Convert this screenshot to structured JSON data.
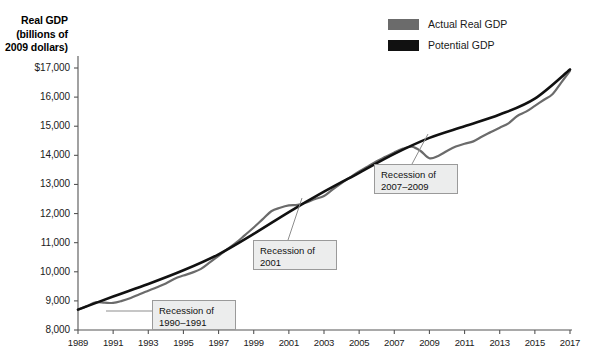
{
  "chart_data": {
    "type": "line",
    "title": "Real GDP (billions of 2009 dollars)",
    "ylabel_line1": "Real GDP",
    "ylabel_line2": "(billions of",
    "ylabel_line3": "2009 dollars)",
    "xlabel": "",
    "xlim": [
      1989,
      2017
    ],
    "ylim": [
      8000,
      17000
    ],
    "grid": false,
    "legend_position": "top-right",
    "ytick_labels": [
      "$17,000",
      "16,000",
      "15,000",
      "14,000",
      "13,000",
      "12,000",
      "11,000",
      "10,000",
      "9,000",
      "8,000"
    ],
    "ytick_values": [
      17000,
      16000,
      15000,
      14000,
      13000,
      12000,
      11000,
      10000,
      9000,
      8000
    ],
    "xtick_labels": [
      "1989",
      "1991",
      "1993",
      "1995",
      "1997",
      "1999",
      "2001",
      "2003",
      "2005",
      "2007",
      "2009",
      "2011",
      "2013",
      "2015",
      "2017"
    ],
    "xtick_values": [
      1989,
      1991,
      1993,
      1995,
      1997,
      1999,
      2001,
      2003,
      2005,
      2007,
      2009,
      2011,
      2013,
      2015,
      2017
    ],
    "colors": {
      "actual": "#6b6b6b",
      "potential": "#111111",
      "axis": "#555555",
      "callout_fill": "#eceded",
      "callout_border": "#9a9a9a"
    },
    "series": [
      {
        "name": "Actual Real GDP",
        "color": "#6b6b6b",
        "x": [
          1989,
          1989.5,
          1990,
          1990.5,
          1991,
          1991.5,
          1992,
          1992.5,
          1993,
          1993.5,
          1994,
          1994.5,
          1995,
          1995.5,
          1996,
          1996.5,
          1997,
          1997.5,
          1998,
          1998.5,
          1999,
          1999.5,
          2000,
          2000.5,
          2001,
          2001.5,
          2002,
          2002.5,
          2003,
          2003.5,
          2004,
          2004.5,
          2005,
          2005.5,
          2006,
          2006.5,
          2007,
          2007.5,
          2008,
          2008.5,
          2009,
          2009.5,
          2010,
          2010.5,
          2011,
          2011.5,
          2012,
          2012.5,
          2013,
          2013.5,
          2014,
          2014.5,
          2015,
          2015.5,
          2016,
          2016.5,
          2017
        ],
        "y": [
          8700,
          8820,
          8950,
          8940,
          8930,
          9000,
          9100,
          9230,
          9350,
          9470,
          9600,
          9760,
          9870,
          9970,
          10100,
          10320,
          10550,
          10780,
          11000,
          11260,
          11520,
          11800,
          12080,
          12200,
          12280,
          12300,
          12380,
          12500,
          12600,
          12830,
          13050,
          13250,
          13450,
          13620,
          13800,
          13950,
          14100,
          14230,
          14300,
          14150,
          13900,
          13980,
          14150,
          14300,
          14400,
          14480,
          14650,
          14800,
          14950,
          15100,
          15350,
          15500,
          15700,
          15900,
          16100,
          16500,
          16900
        ]
      },
      {
        "name": "Potential GDP",
        "color": "#111111",
        "x": [
          1989,
          1991,
          1993,
          1995,
          1997,
          1999,
          2001,
          2003,
          2005,
          2007,
          2009,
          2011,
          2013,
          2015,
          2017
        ],
        "y": [
          8700,
          9150,
          9580,
          10050,
          10600,
          11300,
          12050,
          12750,
          13400,
          14050,
          14600,
          15000,
          15400,
          15950,
          16950
        ]
      }
    ],
    "annotations": [
      {
        "id": "recession-1990-1991",
        "label_line1": "Recession of",
        "label_line2": "1990–1991",
        "box_x": 152,
        "box_y": 300,
        "box_w": 84,
        "box_h": 30,
        "leader_x1": 152,
        "leader_y1": 311,
        "leader_x2": 106,
        "leader_y2": 311
      },
      {
        "id": "recession-2001",
        "label_line1": "Recession of",
        "label_line2": "2001",
        "box_x": 253,
        "box_y": 240,
        "box_w": 84,
        "box_h": 30,
        "leader_x1": 288,
        "leader_y1": 240,
        "leader_x2": 302,
        "leader_y2": 198
      },
      {
        "id": "recession-2007-2009",
        "label_line1": "Recession of",
        "label_line2": "2007–2009",
        "box_x": 374,
        "box_y": 164,
        "box_w": 84,
        "box_h": 30,
        "leader_x1": 412,
        "leader_y1": 164,
        "leader_x2": 428,
        "leader_y2": 134
      }
    ]
  },
  "legend": {
    "items": [
      {
        "label": "Actual Real GDP",
        "color": "#6b6b6b"
      },
      {
        "label": "Potential GDP",
        "color": "#111111"
      }
    ]
  }
}
